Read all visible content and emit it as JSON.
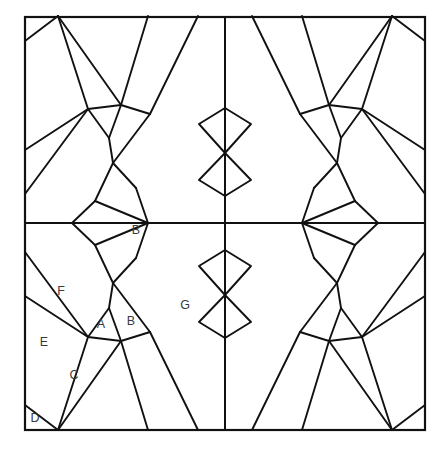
{
  "figure": {
    "background_color": "#ffffff",
    "line_color": "#111111",
    "label_color": "#3a3a3a",
    "width": 444,
    "height": 451,
    "frame": {
      "x0": 25,
      "y0": 17,
      "x1": 425,
      "y1": 430
    },
    "center": {
      "x": 225,
      "y": 223
    },
    "symmetry": "4-fold mirror (vertical and horizontal reflection about center)"
  },
  "labels": [
    {
      "id": "label-A",
      "text": "A",
      "x": 101,
      "y": 325
    },
    {
      "id": "label-B-lower",
      "text": "B",
      "x": 131,
      "y": 322
    },
    {
      "id": "label-C",
      "text": "C",
      "x": 74,
      "y": 376
    },
    {
      "id": "label-D",
      "text": "D",
      "x": 35,
      "y": 419
    },
    {
      "id": "label-E",
      "text": "E",
      "x": 44,
      "y": 343
    },
    {
      "id": "label-F",
      "text": "F",
      "x": 61,
      "y": 292
    },
    {
      "id": "label-G",
      "text": "G",
      "x": 185,
      "y": 306
    },
    {
      "id": "label-B-upper",
      "text": "B",
      "x": 136,
      "y": 231
    }
  ],
  "geometry": {
    "quadrant_paths": [
      "M 25,237 L 25,252",
      "M 25,252 L 88,337",
      "M 25,296 L 88,337",
      "M 25,296 L 25,237",
      "M 88,337 L 58,430",
      "M 25,405 L 58,430",
      "M 25,405 L 25,296",
      "M 88,337 L 109,308",
      "M 109,308 L 113,283",
      "M 113,283 L 95,245",
      "M 95,245 L 72,223",
      "M 113,283 L 150,332",
      "M 109,308 L 121,341",
      "M 121,341 L 150,332",
      "M 121,341 L 148,430",
      "M 150,332 L 198,430",
      "M 88,337 L 121,341",
      "M 95,245 L 148,223",
      "M 113,283 L 136,258",
      "M 136,258 L 148,223",
      "M 58,430 L 121,341"
    ],
    "center_zigzag": [
      "M 225,108 L 199,124 L 225,153 L 199,180 L 225,196 L 225,223",
      "M 225,223 L 199,251 L 225,268 L 199,295 L 225,324 L 225,340",
      "M 225,223 L 197,212",
      "M 225,223 L 253,234"
    ]
  }
}
